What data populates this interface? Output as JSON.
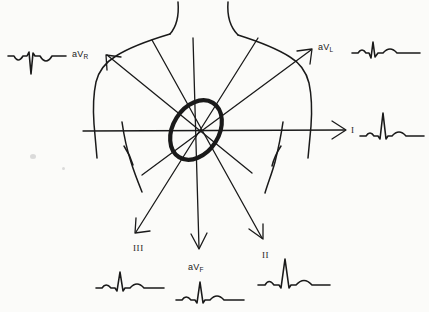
{
  "figure": {
    "kind": "hand-drawn ecg hexaxial lead axis diagram",
    "background_color": "#fbfbf9",
    "ink_color": "#1a1a1a",
    "width": 429,
    "height": 312
  },
  "labels": {
    "avr": {
      "base": "aV",
      "sub": "R",
      "x": 72,
      "y": 49
    },
    "avl": {
      "base": "aV",
      "sub": "L",
      "x": 318,
      "y": 42
    },
    "lead_i": {
      "text": "I",
      "x": 351,
      "y": 126
    },
    "lead_ii": {
      "text": "II",
      "x": 262,
      "y": 251
    },
    "lead_iii": {
      "text": "III",
      "x": 134,
      "y": 244
    },
    "avf": {
      "base": "aV",
      "sub": "F",
      "x": 188,
      "y": 262
    }
  },
  "leads": [
    {
      "name": "aVR",
      "label": "aV",
      "sublabel": "R",
      "degrees": -150,
      "qrs_polarity": "negative",
      "description": "inverted P, deep negative QRS, inverted T",
      "arrow": {
        "x1": 196,
        "y1": 130,
        "x2": 107,
        "y2": 55
      },
      "trace": {
        "x": 8,
        "y": 44,
        "width": 58,
        "height": 30
      }
    },
    {
      "name": "aVL",
      "label": "aV",
      "sublabel": "L",
      "degrees": -30,
      "qrs_polarity": "positive-small",
      "description": "small upright QRS with biphasic deflection",
      "arrow": {
        "x1": 196,
        "y1": 130,
        "x2": 311,
        "y2": 50
      },
      "trace": {
        "x": 352,
        "y": 38,
        "width": 68,
        "height": 28
      }
    },
    {
      "name": "I",
      "label": "I",
      "sublabel": "",
      "degrees": 0,
      "qrs_polarity": "positive",
      "description": "tall upright R wave, small P and T",
      "arrow": {
        "x1": 196,
        "y1": 130,
        "x2": 345,
        "y2": 130
      },
      "trace": {
        "x": 360,
        "y": 112,
        "width": 64,
        "height": 32
      }
    },
    {
      "name": "II",
      "label": "II",
      "sublabel": "",
      "degrees": 60,
      "qrs_polarity": "positive-tall",
      "description": "tallest upright R wave, small P and T",
      "arrow": {
        "x1": 196,
        "y1": 130,
        "x2": 262,
        "y2": 238
      },
      "trace": {
        "x": 258,
        "y": 258,
        "width": 72,
        "height": 34
      }
    },
    {
      "name": "aVF",
      "label": "aV",
      "sublabel": "F",
      "degrees": 90,
      "qrs_polarity": "positive",
      "description": "upright QRS, small P and T",
      "arrow": {
        "x1": 196,
        "y1": 130,
        "x2": 199,
        "y2": 248
      },
      "trace": {
        "x": 176,
        "y": 276,
        "width": 68,
        "height": 32
      }
    },
    {
      "name": "III",
      "label": "III",
      "sublabel": "",
      "degrees": 120,
      "qrs_polarity": "positive-small",
      "description": "modest R wave, small P and T",
      "arrow": {
        "x1": 196,
        "y1": 130,
        "x2": 136,
        "y2": 232
      },
      "trace": {
        "x": 96,
        "y": 266,
        "width": 68,
        "height": 30
      }
    }
  ],
  "heart": {
    "center_x": 196,
    "center_y": 130,
    "rx": 32,
    "ry": 23,
    "rotation_degrees": -58,
    "stroke_width": 4
  },
  "torso": {
    "description": "hand drawn outline of neck, shoulders, arms and chest"
  }
}
